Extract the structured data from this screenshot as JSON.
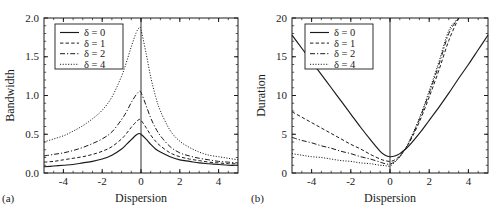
{
  "figure": {
    "panels": [
      {
        "tag": "(a)",
        "xlabel": "Dispersion",
        "ylabel": "Bandwidth",
        "xticks": [
          "-4",
          "-2",
          "0",
          "2",
          "4"
        ],
        "yticks": [
          "0.0",
          "0.5",
          "1.0",
          "1.5",
          "2.0"
        ]
      },
      {
        "tag": "(b)",
        "xlabel": "Dispersion",
        "ylabel": "Duration",
        "xticks": [
          "-4",
          "-2",
          "0",
          "2",
          "4"
        ],
        "yticks": [
          "0",
          "5",
          "10",
          "15",
          "20"
        ]
      }
    ],
    "legend": {
      "entries": [
        {
          "label": "δ = 0",
          "style": "solid"
        },
        {
          "label": "δ = 1",
          "style": "dashed"
        },
        {
          "label": "δ = 2",
          "style": "dashdot"
        },
        {
          "label": "δ = 4",
          "style": "dotted"
        }
      ]
    },
    "colors": {
      "line": "#1a1a1a",
      "frame": "#1a1a1a",
      "background": "#ffffff"
    }
  },
  "chart_data": [
    {
      "type": "line",
      "title": "",
      "panel": "(a)",
      "xlabel": "Dispersion",
      "ylabel": "Bandwidth",
      "xlim": [
        -5,
        5
      ],
      "ylim": [
        0,
        2.0
      ],
      "xticks": [
        -4,
        -2,
        0,
        2,
        4
      ],
      "yticks": [
        0.0,
        0.5,
        1.0,
        1.5,
        2.0
      ],
      "grid": false,
      "legend_position": "upper-left",
      "vertical_reference_line_x": 0,
      "x": [
        -5,
        -4.5,
        -4,
        -3.5,
        -3,
        -2.5,
        -2,
        -1.5,
        -1,
        -0.75,
        -0.5,
        -0.25,
        -0.1,
        0,
        0.25,
        0.5,
        0.75,
        1,
        1.5,
        2,
        2.5,
        3,
        3.5,
        4,
        4.5,
        5
      ],
      "series": [
        {
          "name": "δ = 0",
          "style": "solid",
          "values": [
            0.08,
            0.09,
            0.1,
            0.11,
            0.13,
            0.15,
            0.18,
            0.23,
            0.31,
            0.37,
            0.43,
            0.49,
            0.51,
            0.5,
            0.44,
            0.37,
            0.31,
            0.27,
            0.21,
            0.17,
            0.15,
            0.13,
            0.12,
            0.11,
            0.1,
            0.1
          ]
        },
        {
          "name": "δ = 1",
          "style": "dashed",
          "values": [
            0.14,
            0.15,
            0.17,
            0.19,
            0.21,
            0.24,
            0.28,
            0.34,
            0.44,
            0.51,
            0.59,
            0.66,
            0.69,
            0.68,
            0.59,
            0.49,
            0.41,
            0.35,
            0.26,
            0.21,
            0.18,
            0.16,
            0.14,
            0.13,
            0.12,
            0.12
          ]
        },
        {
          "name": "δ = 2",
          "style": "dashdot",
          "values": [
            0.22,
            0.24,
            0.26,
            0.29,
            0.33,
            0.38,
            0.44,
            0.53,
            0.69,
            0.79,
            0.91,
            1.01,
            1.05,
            1.04,
            0.88,
            0.71,
            0.58,
            0.48,
            0.34,
            0.26,
            0.22,
            0.19,
            0.17,
            0.15,
            0.14,
            0.13
          ]
        },
        {
          "name": "δ = 4",
          "style": "dotted",
          "values": [
            0.4,
            0.44,
            0.48,
            0.54,
            0.61,
            0.7,
            0.81,
            0.98,
            1.25,
            1.43,
            1.63,
            1.81,
            1.87,
            1.85,
            1.56,
            1.24,
            0.99,
            0.8,
            0.55,
            0.41,
            0.33,
            0.27,
            0.23,
            0.21,
            0.19,
            0.17
          ]
        }
      ]
    },
    {
      "type": "line",
      "title": "",
      "panel": "(b)",
      "xlabel": "Dispersion",
      "ylabel": "Duration",
      "xlim": [
        -5,
        5
      ],
      "ylim": [
        0,
        20
      ],
      "xticks": [
        -4,
        -2,
        0,
        2,
        4
      ],
      "yticks": [
        0,
        5,
        10,
        15,
        20
      ],
      "grid": false,
      "legend_position": "upper-left",
      "vertical_reference_line_x": 0,
      "x": [
        -5,
        -4.5,
        -4,
        -3.5,
        -3,
        -2.5,
        -2,
        -1.5,
        -1,
        -0.5,
        -0.25,
        0,
        0.25,
        0.5,
        0.75,
        1,
        1.5,
        2,
        2.5,
        3,
        3.5,
        4,
        4.5,
        5
      ],
      "series": [
        {
          "name": "δ = 0",
          "style": "solid",
          "values": [
            17.8,
            16.1,
            14.4,
            12.7,
            11.0,
            9.3,
            7.6,
            5.9,
            4.3,
            2.8,
            2.3,
            2.1,
            2.2,
            2.5,
            3.0,
            3.6,
            5.1,
            6.8,
            8.5,
            10.3,
            12.2,
            14.0,
            15.9,
            17.8
          ]
        },
        {
          "name": "δ = 1",
          "style": "dashed",
          "values": [
            7.9,
            7.2,
            6.5,
            5.8,
            5.1,
            4.4,
            3.7,
            3.1,
            2.4,
            1.8,
            1.6,
            1.5,
            1.7,
            2.2,
            3.0,
            4.0,
            6.6,
            9.8,
            13.3,
            17.1,
            20.0,
            null,
            null,
            null
          ]
        },
        {
          "name": "δ = 2",
          "style": "dashdot",
          "values": [
            4.6,
            4.2,
            3.9,
            3.5,
            3.2,
            2.8,
            2.5,
            2.1,
            1.8,
            1.4,
            1.2,
            1.15,
            1.5,
            2.1,
            3.0,
            4.1,
            6.9,
            10.3,
            14.0,
            18.0,
            20.0,
            null,
            null,
            null
          ]
        },
        {
          "name": "δ = 4",
          "style": "dotted",
          "values": [
            2.5,
            2.3,
            2.1,
            2.0,
            1.8,
            1.6,
            1.5,
            1.3,
            1.2,
            1.0,
            0.95,
            0.9,
            1.4,
            2.1,
            3.0,
            4.2,
            7.1,
            10.6,
            14.4,
            18.4,
            20.0,
            null,
            null,
            null
          ]
        }
      ]
    }
  ]
}
